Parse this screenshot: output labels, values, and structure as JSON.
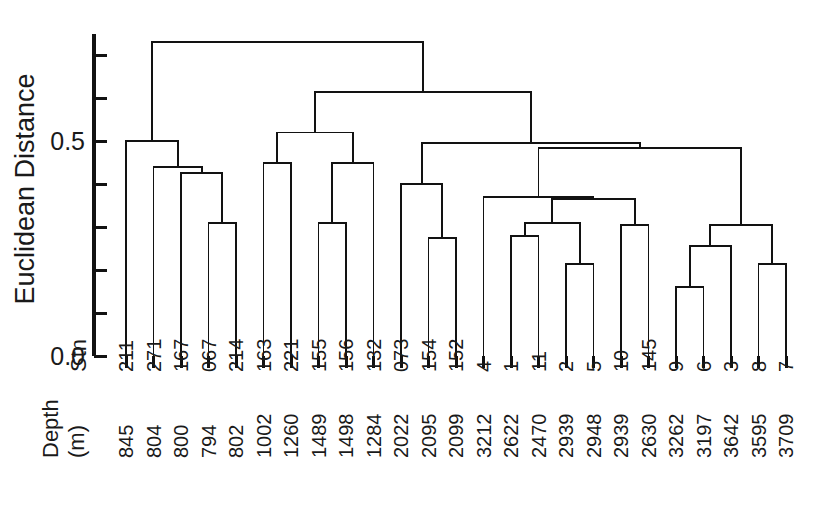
{
  "chart_data": {
    "type": "dendrogram",
    "title": "",
    "ylabel": "Euclidean Distance",
    "xlabel": "",
    "ylim": [
      0.0,
      0.74
    ],
    "grid": false,
    "legend": null,
    "y_ticks_labeled": [
      "0.0",
      "0.5"
    ],
    "y_tick_values_labeled": [
      0.0,
      0.5
    ],
    "y_tick_values_all": [
      0.0,
      0.1,
      0.2,
      0.3,
      0.4,
      0.5,
      0.6,
      0.7
    ],
    "row_headers": {
      "station": "Stn",
      "depth_line1": "Depth",
      "depth_line2": "(m)"
    },
    "leaf_count": 25,
    "leaves": [
      {
        "station": "211",
        "depth": "845"
      },
      {
        "station": "271",
        "depth": "804"
      },
      {
        "station": "167",
        "depth": "800"
      },
      {
        "station": "067",
        "depth": "794"
      },
      {
        "station": "214",
        "depth": "802"
      },
      {
        "station": "163",
        "depth": "1002"
      },
      {
        "station": "221",
        "depth": "1260"
      },
      {
        "station": "155",
        "depth": "1489"
      },
      {
        "station": "156",
        "depth": "1498"
      },
      {
        "station": "132",
        "depth": "1284"
      },
      {
        "station": "073",
        "depth": "2022"
      },
      {
        "station": "154",
        "depth": "2095"
      },
      {
        "station": "152",
        "depth": "2099"
      },
      {
        "station": "4",
        "depth": "3212"
      },
      {
        "station": "1",
        "depth": "2622"
      },
      {
        "station": "11",
        "depth": "2470"
      },
      {
        "station": "2",
        "depth": "2939"
      },
      {
        "station": "5",
        "depth": "2948"
      },
      {
        "station": "10",
        "depth": "2939"
      },
      {
        "station": "145",
        "depth": "2630"
      },
      {
        "station": "9",
        "depth": "3262"
      },
      {
        "station": "6",
        "depth": "3197"
      },
      {
        "station": "3",
        "depth": "3642"
      },
      {
        "station": "8",
        "depth": "3595"
      },
      {
        "station": "7",
        "depth": "3709"
      }
    ],
    "merges": [
      {
        "id": "m1",
        "left": "067",
        "right": "214",
        "height": 0.31
      },
      {
        "id": "m2",
        "left": "167",
        "right": "m1",
        "height": 0.425
      },
      {
        "id": "m3",
        "left": "271",
        "right": "m2",
        "height": 0.44
      },
      {
        "id": "m4",
        "left": "211",
        "right": "m3",
        "height": 0.5
      },
      {
        "id": "m5",
        "left": "155",
        "right": "156",
        "height": 0.31
      },
      {
        "id": "m6",
        "left": "m5",
        "right": "132",
        "height": 0.45
      },
      {
        "id": "m7",
        "left": "163",
        "right": "221",
        "height": 0.45
      },
      {
        "id": "m8",
        "left": "m7",
        "right": "m6",
        "height": 0.52
      },
      {
        "id": "m9",
        "left": "154",
        "right": "152",
        "height": 0.275
      },
      {
        "id": "m10",
        "left": "073",
        "right": "m9",
        "height": 0.4
      },
      {
        "id": "m11",
        "left": "2",
        "right": "5",
        "height": 0.215
      },
      {
        "id": "m12",
        "left": "1",
        "right": "11",
        "height": 0.28
      },
      {
        "id": "m13",
        "left": "m12",
        "right": "m11",
        "height": 0.31
      },
      {
        "id": "m14",
        "left": "10",
        "right": "145",
        "height": 0.305
      },
      {
        "id": "m15",
        "left": "m13",
        "right": "m14",
        "height": 0.365
      },
      {
        "id": "m16",
        "left": "9",
        "right": "6",
        "height": 0.16
      },
      {
        "id": "m17",
        "left": "m16",
        "right": "3",
        "height": 0.255
      },
      {
        "id": "m18",
        "left": "8",
        "right": "7",
        "height": 0.215
      },
      {
        "id": "m19",
        "left": "m17",
        "right": "m18",
        "height": 0.305
      },
      {
        "id": "m20",
        "left": "4",
        "right": "m15",
        "height": 0.37
      },
      {
        "id": "m21",
        "left": "m20",
        "right": "m19",
        "height": 0.485
      },
      {
        "id": "m22",
        "left": "m10",
        "right": "m21",
        "height": 0.495
      },
      {
        "id": "m23",
        "left": "m8",
        "right": "m22",
        "height": 0.615
      },
      {
        "id": "m24",
        "left": "m4",
        "right": "m23",
        "height": 0.73
      }
    ]
  }
}
